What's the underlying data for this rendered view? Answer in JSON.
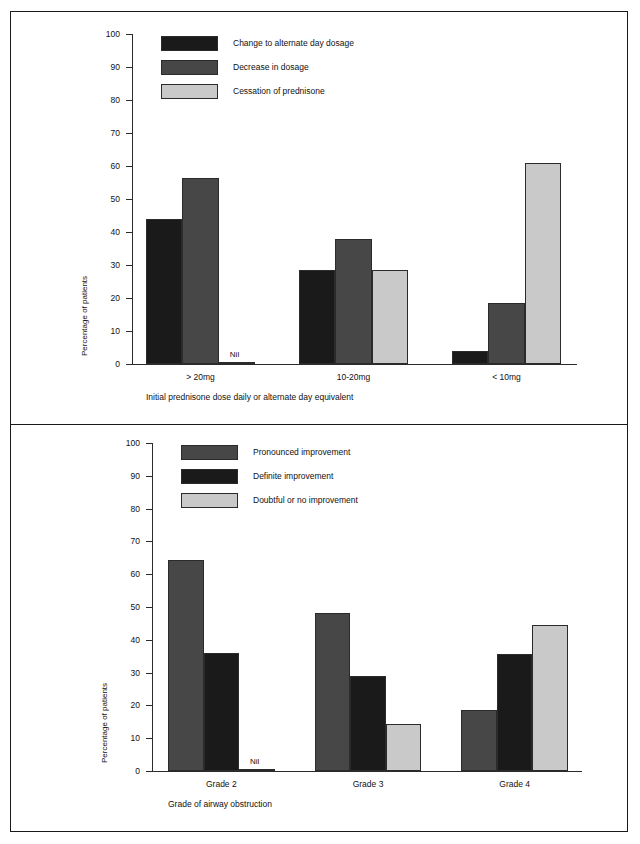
{
  "figure": {
    "colors": {
      "black": "#1a1a1a",
      "dark_gray": "#474747",
      "light_gray": "#c9c9c9",
      "axis": "#2b2b2b",
      "border": "#1a1a1a"
    },
    "panels": [
      {
        "id": "top",
        "legend": [
          {
            "label": "Change to alternate day dosage",
            "color": "#1a1a1a"
          },
          {
            "label": "Decrease in dosage",
            "color": "#474747"
          },
          {
            "label": "Cessation of prednisone",
            "color": "#c9c9c9"
          }
        ],
        "chart_data": {
          "type": "bar",
          "title": "",
          "xlabel": "Initial prednisone dose daily or alternate day equivalent",
          "ylabel": "Percentage of patients",
          "ylim": [
            0,
            100
          ],
          "yticks": [
            0,
            10,
            20,
            30,
            40,
            50,
            60,
            70,
            80,
            90,
            100
          ],
          "grid": false,
          "legend_position": "top-left",
          "categories": [
            "> 20mg",
            "10-20mg",
            "< 10mg"
          ],
          "series": [
            {
              "name": "Change to alternate day dosage",
              "color": "#1a1a1a",
              "values": [
                44.0,
                28.5,
                4.0
              ]
            },
            {
              "name": "Decrease in dosage",
              "color": "#474747",
              "values": [
                56.5,
                38.0,
                18.5
              ]
            },
            {
              "name": "Cessation of prednisone",
              "color": "#c9c9c9",
              "values": [
                0.0,
                28.5,
                61.0
              ]
            }
          ],
          "annotations": [
            {
              "text": "Nil",
              "category": "> 20mg",
              "series": "Cessation of prednisone"
            }
          ]
        }
      },
      {
        "id": "bottom",
        "legend": [
          {
            "label": "Pronounced improvement",
            "color": "#474747"
          },
          {
            "label": "Definite improvement",
            "color": "#1a1a1a"
          },
          {
            "label": "Doubtful or no improvement",
            "color": "#c9c9c9"
          }
        ],
        "chart_data": {
          "type": "bar",
          "title": "",
          "xlabel": "Grade of airway obstruction",
          "ylabel": "Percentage of patients",
          "ylim": [
            0,
            100
          ],
          "yticks": [
            0,
            10,
            20,
            30,
            40,
            50,
            60,
            70,
            80,
            90,
            100
          ],
          "grid": false,
          "legend_position": "top-left",
          "categories": [
            "Grade 2",
            "Grade 3",
            "Grade 4"
          ],
          "series": [
            {
              "name": "Pronounced improvement",
              "color": "#474747",
              "values": [
                64.3,
                48.3,
                18.7
              ]
            },
            {
              "name": "Definite improvement",
              "color": "#1a1a1a",
              "values": [
                36.0,
                29.0,
                35.7
              ]
            },
            {
              "name": "Doubtful or no improvement",
              "color": "#c9c9c9",
              "values": [
                0.0,
                14.3,
                44.6
              ]
            }
          ],
          "annotations": [
            {
              "text": "Nil",
              "category": "Grade 2",
              "series": "Doubtful or no improvement"
            }
          ]
        }
      }
    ]
  }
}
